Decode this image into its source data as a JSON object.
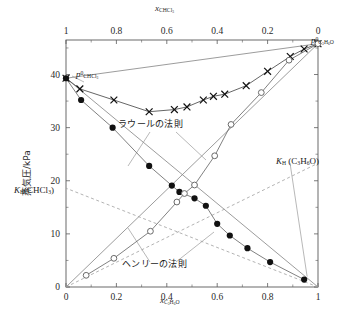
{
  "figure": {
    "kind": "vapour-pressure-composition-diagram",
    "ylabel": "蒸気圧/kPa",
    "top_axis_title_symbol": "x",
    "top_axis_title_sub": "CHCl3",
    "bottom_axis_title_symbol": "x",
    "bottom_axis_title_sub": "C3H6O"
  },
  "annotations": {
    "raoult": "ラウールの法則",
    "henry": "ヘンリーの法則",
    "p0_chcl3_symbol": "p",
    "p0_chcl3_sup": "0",
    "p0_chcl3_sub": "CHCl3",
    "p0_acetone_symbol": "p",
    "p0_acetone_sup": "0",
    "p0_acetone_sub": "C3H6O",
    "kh_chcl3_symbol": "K",
    "kh_chcl3_sub": "H",
    "kh_chcl3_paren": "(CHCl3)",
    "kh_acetone_symbol": "K",
    "kh_acetone_sub": "H",
    "kh_acetone_paren": "(C3H6O)"
  },
  "colors": {
    "axis": "#5a5a5a",
    "raoult_line": "#8a8a8a",
    "henry_line": "#a0a0a0",
    "total_curve": "#555555",
    "filled_marker": "#111111",
    "open_marker_stroke": "#6a6a6a",
    "text": "#1a1a1a"
  },
  "chart_data": {
    "type": "line",
    "title": "",
    "xlabel": "x(C3H6O)",
    "ylabel": "蒸気圧/kPa",
    "xlim": [
      0,
      1
    ],
    "ylim": [
      0,
      46.5
    ],
    "grid": false,
    "legend": "none",
    "top_axis": {
      "label": "x(CHCl3)",
      "direction": "reversed",
      "ticks": [
        1,
        0.8,
        0.6,
        0.4,
        0.2,
        0
      ],
      "tick_labels": [
        "1",
        "0.8",
        "0.6",
        "0.4",
        "0.2",
        "0"
      ],
      "minor_ticks": [
        0.9,
        0.7,
        0.5,
        0.3,
        0.1
      ]
    },
    "bottom_axis": {
      "label": "x(C3H6O)",
      "ticks": [
        0,
        0.2,
        0.4,
        0.6,
        0.8,
        1
      ],
      "tick_labels": [
        "0",
        "0.2",
        "0.4",
        "0.6",
        "0.8",
        "1"
      ],
      "minor_ticks": [
        0.1,
        0.3,
        0.5,
        0.7,
        0.9
      ]
    },
    "y_axis": {
      "ticks": [
        0,
        10,
        20,
        30,
        40
      ],
      "tick_labels": [
        "0",
        "10",
        "20",
        "30",
        "40"
      ],
      "minor_ticks": [
        5,
        15,
        25,
        35,
        45
      ]
    },
    "reference_values": {
      "p0_chcl3": 39.3,
      "p0_acetone": 45.8,
      "kh_chcl3": 18.6,
      "kh_acetone": 23.3
    },
    "series": [
      {
        "name": "total-pressure",
        "marker": "cross",
        "label": "total vapour pressure",
        "points": [
          {
            "x": 0.0,
            "y": 39.3
          },
          {
            "x": 0.055,
            "y": 37.3
          },
          {
            "x": 0.19,
            "y": 35.2
          },
          {
            "x": 0.33,
            "y": 33.0
          },
          {
            "x": 0.43,
            "y": 33.4
          },
          {
            "x": 0.48,
            "y": 33.9
          },
          {
            "x": 0.545,
            "y": 35.2
          },
          {
            "x": 0.585,
            "y": 35.9
          },
          {
            "x": 0.63,
            "y": 36.3
          },
          {
            "x": 0.715,
            "y": 37.9
          },
          {
            "x": 0.8,
            "y": 40.6
          },
          {
            "x": 0.89,
            "y": 43.4
          },
          {
            "x": 0.945,
            "y": 44.8
          },
          {
            "x": 1.0,
            "y": 45.8
          }
        ]
      },
      {
        "name": "partial-pressure-chloroform",
        "marker": "filled-circle",
        "label": "p(CHCl3)",
        "points": [
          {
            "x": 0.0,
            "y": 39.3
          },
          {
            "x": 0.06,
            "y": 35.2
          },
          {
            "x": 0.185,
            "y": 30.0
          },
          {
            "x": 0.33,
            "y": 22.8
          },
          {
            "x": 0.42,
            "y": 19.1
          },
          {
            "x": 0.45,
            "y": 17.9
          },
          {
            "x": 0.51,
            "y": 16.7
          },
          {
            "x": 0.555,
            "y": 15.3
          },
          {
            "x": 0.6,
            "y": 11.9
          },
          {
            "x": 0.65,
            "y": 9.7
          },
          {
            "x": 0.72,
            "y": 7.3
          },
          {
            "x": 0.81,
            "y": 4.7
          },
          {
            "x": 0.945,
            "y": 1.4
          }
        ]
      },
      {
        "name": "partial-pressure-acetone",
        "marker": "open-circle",
        "label": "p(C3H6O)",
        "points": [
          {
            "x": 0.08,
            "y": 2.2
          },
          {
            "x": 0.19,
            "y": 5.4
          },
          {
            "x": 0.335,
            "y": 10.5
          },
          {
            "x": 0.44,
            "y": 16.0
          },
          {
            "x": 0.47,
            "y": 17.6
          },
          {
            "x": 0.51,
            "y": 19.2
          },
          {
            "x": 0.59,
            "y": 24.7
          },
          {
            "x": 0.655,
            "y": 30.6
          },
          {
            "x": 0.775,
            "y": 36.6
          },
          {
            "x": 0.885,
            "y": 42.7
          },
          {
            "x": 1.0,
            "y": 45.8
          }
        ]
      }
    ],
    "raoult_lines": [
      {
        "name": "raoult-chcl3",
        "from": {
          "x": 0,
          "y": 39.3
        },
        "to": {
          "x": 1,
          "y": 0
        }
      },
      {
        "name": "raoult-acetone",
        "from": {
          "x": 0,
          "y": 0
        },
        "to": {
          "x": 1,
          "y": 45.8
        }
      },
      {
        "name": "raoult-total",
        "from": {
          "x": 0,
          "y": 39.3
        },
        "to": {
          "x": 1,
          "y": 45.8
        }
      }
    ],
    "henry_lines": [
      {
        "name": "henry-chcl3",
        "from": {
          "x": 1,
          "y": 0
        },
        "to": {
          "x": 0,
          "y": 18.6
        },
        "style": "dashed"
      },
      {
        "name": "henry-acetone",
        "from": {
          "x": 0,
          "y": 0
        },
        "to": {
          "x": 1,
          "y": 23.3
        },
        "style": "dashed"
      }
    ]
  }
}
